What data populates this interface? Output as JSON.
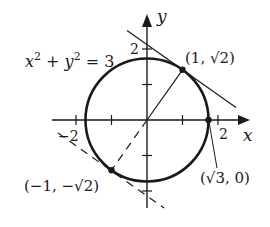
{
  "diagram": {
    "equation_label": {
      "base_x": "x",
      "exp_x": "2",
      "plus": " + ",
      "base_y": "y",
      "exp_y": "2",
      "rhs": " = 3"
    },
    "axes": {
      "x_label": "x",
      "y_label": "y",
      "x_ticks": [
        -2,
        -1,
        1,
        2
      ],
      "y_ticks": [
        -2,
        -1,
        1,
        2
      ],
      "x_tick_labels": {
        "neg2": "−2",
        "pos2": "2"
      },
      "y_tick_labels": {
        "pos2": "2"
      }
    },
    "circle": {
      "center": [
        0,
        0
      ],
      "radius_squared": 3
    },
    "points": {
      "p1": {
        "label": "(1, √2)",
        "x": 1,
        "y": 1.4142
      },
      "p2": {
        "label": "(−1, −√2)",
        "x": -1,
        "y": -1.4142
      },
      "p3": {
        "label": "(√3, 0)",
        "x": 1.7321,
        "y": 0
      }
    },
    "lines": [
      {
        "name": "radius-to-p1",
        "style": "solid",
        "from": [
          0,
          0
        ],
        "to": [
          1,
          1.4142
        ]
      },
      {
        "name": "tangent-at-p1",
        "style": "solid",
        "slope": -0.7071
      },
      {
        "name": "radius-to-p2",
        "style": "dashed",
        "from": [
          0,
          0
        ],
        "to": [
          -1,
          -1.4142
        ]
      },
      {
        "name": "tangent-at-p2",
        "style": "dashed",
        "slope": -0.7071
      }
    ],
    "colors": {
      "ink": "#1a1a1a",
      "background": "#ffffff"
    }
  }
}
